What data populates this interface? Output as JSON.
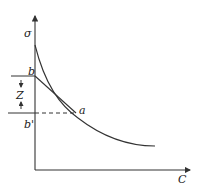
{
  "diagram": {
    "axes": {
      "y_label": "σ",
      "x_label": "C"
    },
    "labels": {
      "point_b": "b",
      "point_b_prime": "b'",
      "point_a": "a",
      "distance_z": "Z"
    },
    "colors": {
      "stroke": "#333333",
      "background": "#ffffff"
    }
  }
}
